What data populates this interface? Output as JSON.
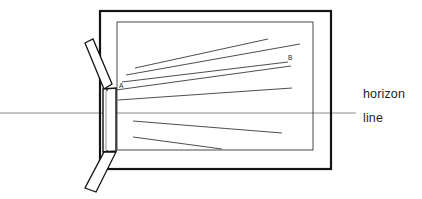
{
  "figure": {
    "type": "diagram",
    "background_color": "#ffffff",
    "ink_color": "#1a1a1a",
    "ray_color": "#3a3a3a",
    "horizon_color": "#8a8a8a"
  },
  "labels": {
    "point_a": "A",
    "point_b": "B",
    "horizon_word": "horizon",
    "line_word": "line",
    "cropped_top_text": ""
  },
  "geometry": {
    "outer_frame": {
      "x": 100,
      "y": 11,
      "width": 231,
      "height": 158,
      "stroke_width": 2.2
    },
    "inner_frame": {
      "x": 117,
      "y": 22,
      "width": 196,
      "height": 128,
      "stroke_width": 0.9
    },
    "horizon_line": {
      "x1": 0,
      "y1": 113,
      "x2": 356,
      "y2": 113,
      "stroke_width": 1.0
    },
    "vanishing_point_A": {
      "x": 116,
      "y": 90
    },
    "point_B": {
      "x": 288,
      "y": 62
    },
    "shutter_pane": {
      "top_left": [
        103,
        89
      ],
      "top_right": [
        116,
        88
      ],
      "bottom_right": [
        116,
        151
      ],
      "bottom_left": [
        103,
        152
      ]
    },
    "upper_flap": {
      "points": [
        [
          85,
          43
        ],
        [
          93,
          39
        ],
        [
          112,
          84
        ],
        [
          104,
          89
        ]
      ]
    },
    "lower_flap": {
      "points": [
        [
          104,
          152
        ],
        [
          116,
          152
        ],
        [
          96,
          192
        ],
        [
          85,
          188
        ]
      ]
    }
  },
  "rays": {
    "upper_fan_count": 5,
    "lower_fan_count": 2,
    "upper": [
      {
        "id": "ray-u1",
        "x1": 135,
        "y1": 68,
        "x2": 268,
        "y2": 39
      },
      {
        "id": "ray-u2",
        "x1": 126,
        "y1": 75,
        "x2": 300,
        "y2": 44
      },
      {
        "id": "ray-u3",
        "x1": 122,
        "y1": 82,
        "x2": 288,
        "y2": 62
      },
      {
        "id": "ray-u4",
        "x1": 116,
        "y1": 90,
        "x2": 291,
        "y2": 66
      },
      {
        "id": "ray-u5",
        "x1": 118,
        "y1": 100,
        "x2": 292,
        "y2": 88
      }
    ],
    "lower": [
      {
        "id": "ray-l1",
        "x1": 133,
        "y1": 121,
        "x2": 282,
        "y2": 133
      },
      {
        "id": "ray-l2",
        "x1": 133,
        "y1": 137,
        "x2": 222,
        "y2": 149
      }
    ]
  }
}
